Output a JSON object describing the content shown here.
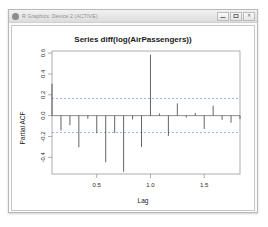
{
  "window": {
    "title": "R Graphics: Device 2 (ACTIVE)",
    "icon": "r-device-icon",
    "controls": {
      "minimize_label": "",
      "maximize_label": "",
      "close_label": "✕"
    }
  },
  "chart_data": {
    "type": "bar",
    "title": "Series  diff(log(AirPassengers))",
    "xlabel": "Lag",
    "ylabel": "Partial ACF",
    "xlim": [
      0.0833,
      1.8333
    ],
    "ylim": [
      -0.56,
      0.62
    ],
    "grid": false,
    "legend": null,
    "xticks": [
      0.5,
      1.0,
      1.5
    ],
    "xtick_labels": [
      "0.5",
      "1.0",
      "1.5"
    ],
    "yticks": [
      -0.4,
      -0.2,
      0.0,
      0.2,
      0.4,
      0.6
    ],
    "ytick_labels": [
      "-0.4",
      "-0.2",
      "0.0",
      "0.2",
      "0.4",
      "0.6"
    ],
    "zero_line": 0.0,
    "confidence_bands": [
      0.163,
      -0.163
    ],
    "confidence_style": "dashed",
    "confidence_color": "#3a5fcd",
    "x": [
      0.0833,
      0.1667,
      0.25,
      0.3333,
      0.4167,
      0.5,
      0.5833,
      0.6667,
      0.75,
      0.8333,
      0.9167,
      1.0,
      1.0833,
      1.1667,
      1.25,
      1.3333,
      1.4167,
      1.5,
      1.5833,
      1.6667,
      1.75,
      1.8333
    ],
    "values": [
      0.306,
      -0.142,
      -0.092,
      -0.302,
      -0.03,
      -0.168,
      -0.447,
      -0.166,
      -0.538,
      -0.037,
      -0.3,
      0.584,
      0.021,
      -0.195,
      0.118,
      -0.018,
      0.026,
      -0.128,
      0.095,
      -0.04,
      -0.068,
      -0.031
    ],
    "series_name": "Partial ACF"
  }
}
